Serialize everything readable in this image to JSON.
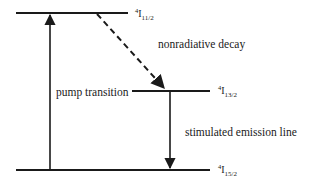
{
  "diagram": {
    "type": "energy-level-diagram",
    "colors": {
      "line": "#1a1a1a",
      "background": "#ffffff"
    },
    "levels": [
      {
        "id": "upper",
        "prefix": "4",
        "symbol": "I",
        "subscript": "11/2"
      },
      {
        "id": "middle",
        "prefix": "4",
        "symbol": "I",
        "subscript": "13/2"
      },
      {
        "id": "ground",
        "prefix": "4",
        "symbol": "I",
        "subscript": "15/2"
      }
    ],
    "transitions": [
      {
        "id": "pump",
        "label": "pump transition",
        "from": "ground",
        "to": "upper",
        "style": "solid"
      },
      {
        "id": "decay",
        "label": "nonradiative decay",
        "from": "upper",
        "to": "middle",
        "style": "dashed"
      },
      {
        "id": "emission",
        "label": "stimulated emission line",
        "from": "middle",
        "to": "ground",
        "style": "solid"
      }
    ]
  }
}
